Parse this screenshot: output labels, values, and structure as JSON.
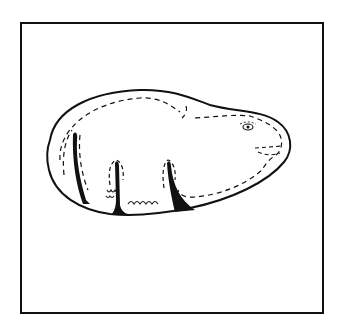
{
  "figure": {
    "description": "Line drawing of an animal figure (bear-like) carved on an oval pebble, shown inside a square frame",
    "colors": {
      "background": "#ffffff",
      "stroke": "#111111",
      "fill": "#ffffff",
      "legs": "#111111"
    }
  }
}
